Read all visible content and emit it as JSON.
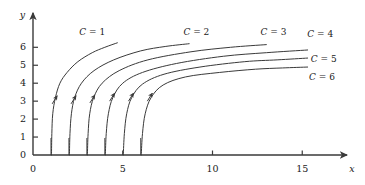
{
  "figure": {
    "kind": "slope-field-solution-curves",
    "background_color": "#ffffff",
    "ink_color": "#3a3a3a",
    "text_color": "#1a1a1a"
  },
  "axes": {
    "x_name": "x",
    "y_name": "y",
    "x_ticks": [
      {
        "value": 0,
        "label": "0"
      },
      {
        "value": 1,
        "label": ""
      },
      {
        "value": 2,
        "label": ""
      },
      {
        "value": 3,
        "label": ""
      },
      {
        "value": 4,
        "label": ""
      },
      {
        "value": 5,
        "label": "5"
      },
      {
        "value": 6,
        "label": ""
      },
      {
        "value": 10,
        "label": "10"
      },
      {
        "value": 15,
        "label": "15"
      }
    ],
    "y_ticks": [
      {
        "value": 0,
        "label": "0"
      },
      {
        "value": 1,
        "label": "1"
      },
      {
        "value": 2,
        "label": "2"
      },
      {
        "value": 3,
        "label": "3"
      },
      {
        "value": 4,
        "label": "4"
      },
      {
        "value": 5,
        "label": "5"
      },
      {
        "value": 6,
        "label": "6"
      }
    ],
    "xlim": [
      0,
      17.5
    ],
    "ylim": [
      0,
      7.9
    ]
  },
  "chart_data": {
    "type": "line",
    "title": "",
    "subtitle": "",
    "xlabel": "x",
    "ylabel": "y",
    "xlim": [
      0,
      17.5
    ],
    "ylim": [
      0,
      7.9
    ],
    "grid": false,
    "legend_position": "inline-curve-labels",
    "x_ticks": [
      0,
      5,
      10,
      15
    ],
    "x_minor_ticks": [
      1,
      2,
      3,
      4,
      6
    ],
    "y_ticks": [
      0,
      1,
      2,
      3,
      4,
      5,
      6
    ],
    "curve_family": "y = k*ln(x - C), vertical asymptote at x = C",
    "series": [
      {
        "name": "C = 1",
        "label": "C = 1",
        "C": 1,
        "asymptote_x": 1,
        "label_pos": {
          "x": 3.3,
          "y": 7.1
        },
        "arrow_at": {
          "x": 1.35,
          "y": 3.3
        },
        "x_start": 1.02,
        "x_end": 4.7,
        "y_end": 6.25,
        "points": [
          {
            "x": 1.03,
            "y": 0.0
          },
          {
            "x": 1.05,
            "y": 1.2
          },
          {
            "x": 1.1,
            "y": 2.3
          },
          {
            "x": 1.25,
            "y": 3.2
          },
          {
            "x": 1.5,
            "y": 4.0
          },
          {
            "x": 1.9,
            "y": 4.6
          },
          {
            "x": 2.5,
            "y": 5.2
          },
          {
            "x": 3.3,
            "y": 5.7
          },
          {
            "x": 4.0,
            "y": 6.0
          },
          {
            "x": 4.7,
            "y": 6.25
          }
        ]
      },
      {
        "name": "C = 2",
        "label": "C = 2",
        "C": 2,
        "asymptote_x": 2,
        "label_pos": {
          "x": 9.1,
          "y": 7.1
        },
        "arrow_at": {
          "x": 2.4,
          "y": 3.3
        },
        "x_start": 2.02,
        "x_end": 8.7,
        "y_end": 6.2,
        "points": [
          {
            "x": 2.03,
            "y": 0.0
          },
          {
            "x": 2.06,
            "y": 1.2
          },
          {
            "x": 2.14,
            "y": 2.3
          },
          {
            "x": 2.32,
            "y": 3.2
          },
          {
            "x": 2.7,
            "y": 4.0
          },
          {
            "x": 3.4,
            "y": 4.7
          },
          {
            "x": 4.5,
            "y": 5.3
          },
          {
            "x": 6.0,
            "y": 5.8
          },
          {
            "x": 7.4,
            "y": 6.05
          },
          {
            "x": 8.7,
            "y": 6.2
          }
        ]
      },
      {
        "name": "C = 3",
        "label": "C = 3",
        "C": 3,
        "asymptote_x": 3,
        "label_pos": {
          "x": 13.4,
          "y": 7.1
        },
        "arrow_at": {
          "x": 3.45,
          "y": 3.35
        },
        "x_start": 3.02,
        "x_end": 13.0,
        "y_end": 6.15,
        "points": [
          {
            "x": 3.03,
            "y": 0.0
          },
          {
            "x": 3.07,
            "y": 1.2
          },
          {
            "x": 3.16,
            "y": 2.3
          },
          {
            "x": 3.38,
            "y": 3.2
          },
          {
            "x": 3.85,
            "y": 4.0
          },
          {
            "x": 4.8,
            "y": 4.7
          },
          {
            "x": 6.4,
            "y": 5.3
          },
          {
            "x": 8.8,
            "y": 5.75
          },
          {
            "x": 11.0,
            "y": 6.0
          },
          {
            "x": 13.0,
            "y": 6.15
          }
        ]
      },
      {
        "name": "C = 4",
        "label": "C = 4",
        "C": 4,
        "asymptote_x": 4,
        "label_pos": {
          "x": 16.0,
          "y": 6.95
        },
        "arrow_at": {
          "x": 4.55,
          "y": 3.45
        },
        "x_start": 4.02,
        "x_end": 15.3,
        "y_end": 5.85,
        "points": [
          {
            "x": 4.03,
            "y": 0.0
          },
          {
            "x": 4.08,
            "y": 1.2
          },
          {
            "x": 4.2,
            "y": 2.3
          },
          {
            "x": 4.45,
            "y": 3.2
          },
          {
            "x": 5.0,
            "y": 4.0
          },
          {
            "x": 6.1,
            "y": 4.6
          },
          {
            "x": 8.0,
            "y": 5.1
          },
          {
            "x": 10.6,
            "y": 5.5
          },
          {
            "x": 13.0,
            "y": 5.7
          },
          {
            "x": 15.3,
            "y": 5.85
          }
        ]
      },
      {
        "name": "C = 5",
        "label": "C = 5",
        "C": 5,
        "asymptote_x": 5,
        "label_pos": {
          "x": 16.2,
          "y": 5.55
        },
        "arrow_at": {
          "x": 5.6,
          "y": 3.45
        },
        "x_start": 5.02,
        "x_end": 15.3,
        "y_end": 5.4,
        "points": [
          {
            "x": 5.03,
            "y": 0.0
          },
          {
            "x": 5.09,
            "y": 1.2
          },
          {
            "x": 5.22,
            "y": 2.3
          },
          {
            "x": 5.5,
            "y": 3.2
          },
          {
            "x": 6.1,
            "y": 3.95
          },
          {
            "x": 7.3,
            "y": 4.5
          },
          {
            "x": 9.3,
            "y": 4.9
          },
          {
            "x": 11.8,
            "y": 5.2
          },
          {
            "x": 13.6,
            "y": 5.3
          },
          {
            "x": 15.3,
            "y": 5.4
          }
        ]
      },
      {
        "name": "C = 6",
        "label": "C = 6",
        "C": 6,
        "asymptote_x": 6,
        "label_pos": {
          "x": 16.1,
          "y": 4.55
        },
        "arrow_at": {
          "x": 6.65,
          "y": 3.45
        },
        "x_start": 6.02,
        "x_end": 15.3,
        "y_end": 4.9,
        "points": [
          {
            "x": 6.03,
            "y": 0.0
          },
          {
            "x": 6.1,
            "y": 1.2
          },
          {
            "x": 6.25,
            "y": 2.3
          },
          {
            "x": 6.58,
            "y": 3.2
          },
          {
            "x": 7.25,
            "y": 3.9
          },
          {
            "x": 8.5,
            "y": 4.35
          },
          {
            "x": 10.4,
            "y": 4.6
          },
          {
            "x": 12.4,
            "y": 4.78
          },
          {
            "x": 13.9,
            "y": 4.85
          },
          {
            "x": 15.3,
            "y": 4.9
          }
        ]
      }
    ]
  }
}
